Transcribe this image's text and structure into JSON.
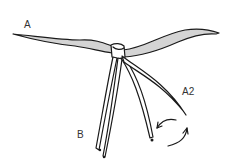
{
  "diagram": {
    "title": "",
    "labels": {
      "a": "A",
      "a2": "A2",
      "b": "B"
    },
    "colors": {
      "stroke": "#1a1a1a",
      "fill_shaded": "#d4d4d4",
      "fill_plain": "#ffffff",
      "background": "#ffffff"
    },
    "annotations": [
      {
        "type": "curved-arrow",
        "meaning": "rotate A2 strand around",
        "near": "A2"
      }
    ]
  }
}
